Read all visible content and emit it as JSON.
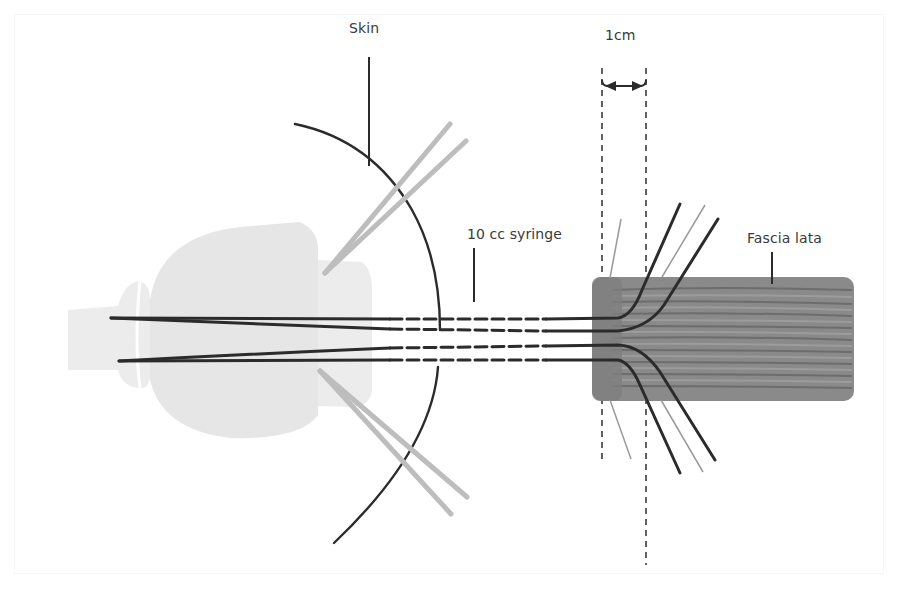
{
  "figure": {
    "labels": {
      "skin": "Skin",
      "measure": "1cm",
      "syringe": "10 cc syringe",
      "fascia": "Fascia lata"
    },
    "colors": {
      "line_dark": "#2b2b2b",
      "line_gray": "#bdbdbd",
      "syringe_body": "#e6e6e6",
      "syringe_hub": "#ececec",
      "fascia_fill": "#8a8a8a",
      "fascia_stripe": "#6a6a6a",
      "fascia_light_stripe": "#a4a4a4",
      "label_text": "#3a3a3a"
    },
    "measure": {
      "value": "1",
      "unit": "cm"
    }
  }
}
